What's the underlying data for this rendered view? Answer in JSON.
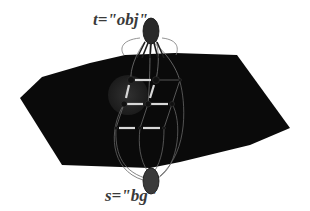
{
  "diagram": {
    "type": "graph-cut illustration",
    "terminals": {
      "sink": {
        "label": "t=\"obj\""
      },
      "source": {
        "label": "s=\"bg\""
      }
    },
    "grid": {
      "rows": 3,
      "cols": 3
    },
    "colors": {
      "object": "#0a0a0a",
      "terminal": "#3a3a3a",
      "edge": "#555555",
      "cut_edge": "#d8d8d8"
    }
  }
}
